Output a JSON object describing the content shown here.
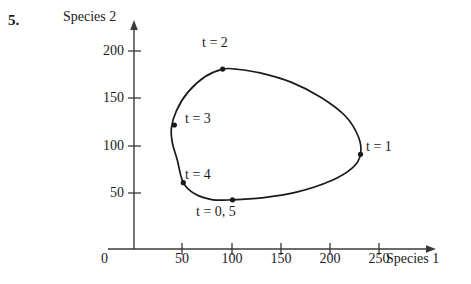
{
  "problem": {
    "number": "5."
  },
  "axes": {
    "ylabel": "Species 2",
    "xlabel": "Species 1",
    "origin_label": "0",
    "yticks": [
      "50",
      "100",
      "150",
      "200"
    ],
    "xticks": [
      "50",
      "100",
      "150",
      "200",
      "250"
    ]
  },
  "annotations": {
    "t1": "t = 1",
    "t2": "t = 2",
    "t3": "t = 3",
    "t4": "t = 4",
    "t05": "t = 0, 5"
  },
  "colors": {
    "curve": "#1a1a1a",
    "axis": "#3a3a3a",
    "background": "#ffffff",
    "text": "#1a1a1a"
  },
  "chart_data": {
    "type": "line",
    "title": "",
    "subtitle": "",
    "xlabel": "Species 1",
    "ylabel": "Species 2",
    "xlim": [
      0,
      275
    ],
    "ylim": [
      0,
      225
    ],
    "grid": false,
    "legend_position": "none",
    "closed_curve": true,
    "xticks": [
      50,
      100,
      150,
      200,
      250
    ],
    "yticks": [
      50,
      100,
      150,
      200
    ],
    "marked_points": [
      {
        "label": "t = 0, 5",
        "t": 0,
        "x": 100,
        "y": 52,
        "label_position": "below"
      },
      {
        "label": "t = 1",
        "t": 1,
        "x": 230,
        "y": 100,
        "label_position": "right"
      },
      {
        "label": "t = 2",
        "t": 2,
        "x": 90,
        "y": 190,
        "label_position": "above"
      },
      {
        "label": "t = 3",
        "t": 3,
        "x": 41,
        "y": 131,
        "label_position": "right"
      },
      {
        "label": "t = 4",
        "t": 4,
        "x": 50,
        "y": 70,
        "label_position": "right"
      }
    ],
    "series": [
      {
        "name": "trajectory",
        "x": [
          100,
          130,
          165,
          200,
          222,
          230,
          228,
          215,
          190,
          160,
          128,
          103,
          90,
          72,
          55,
          43,
          38,
          39,
          44,
          50,
          62,
          80,
          100
        ],
        "y": [
          52,
          54,
          60,
          72,
          86,
          100,
          118,
          140,
          160,
          176,
          186,
          190,
          190,
          182,
          166,
          146,
          128,
          112,
          94,
          70,
          58,
          52,
          52
        ]
      }
    ]
  }
}
